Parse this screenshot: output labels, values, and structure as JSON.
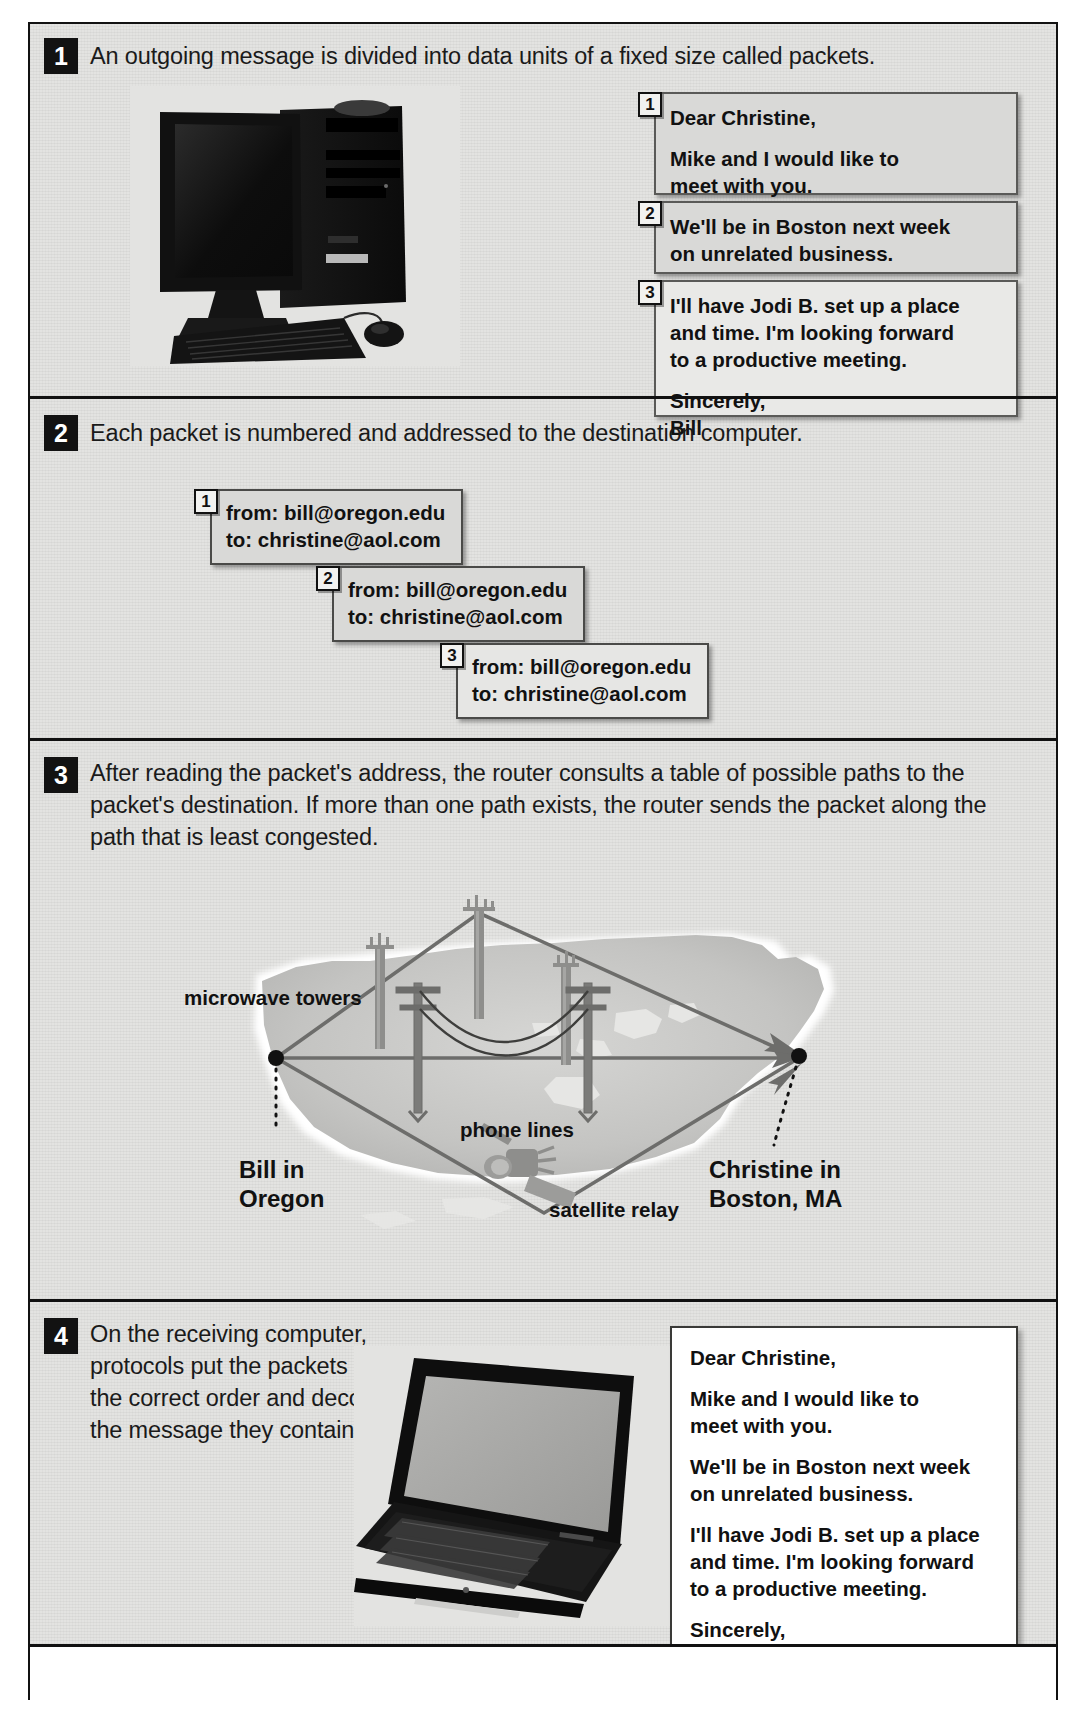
{
  "figure": {
    "steps": [
      {
        "number": "1",
        "text": "An outgoing message is divided into data units of a fixed size called packets.",
        "image": "desktop-computer-photo"
      },
      {
        "number": "2",
        "text": "Each packet is numbered and addressed to the destination computer."
      },
      {
        "number": "3",
        "text": "After reading the packet's address, the router consults a table of possible paths to the packet's destination. If more than one path exists, the router sends the packet along the path that is least congested."
      },
      {
        "number": "4",
        "text": "On the receiving computer, protocols put the packets in the correct order and decode the message they contain.",
        "image": "laptop-computer-photo"
      }
    ]
  },
  "message_packets": [
    {
      "number": "1",
      "lines": [
        "Dear Christine,",
        "Mike and I would like to",
        "meet with you."
      ]
    },
    {
      "number": "2",
      "lines": [
        "We'll be in Boston next week",
        "on unrelated business."
      ]
    },
    {
      "number": "3",
      "lines": [
        "I'll have Jodi B. set up a place",
        "and time. I'm looking forward",
        "to a productive meeting.",
        "Sincerely,",
        "Bill"
      ]
    }
  ],
  "addressed_packets": [
    {
      "number": "1",
      "from": "from: bill@oregon.edu",
      "to": "to: christine@aol.com"
    },
    {
      "number": "2",
      "from": "from: bill@oregon.edu",
      "to": "to: christine@aol.com"
    },
    {
      "number": "3",
      "from": "from: bill@oregon.edu",
      "to": "to: christine@aol.com"
    }
  ],
  "map": {
    "labels": {
      "microwave_towers": "microwave towers",
      "phone_lines": "phone lines",
      "satellite_relay": "satellite relay",
      "origin_line1": "Bill in",
      "origin_line2": "Oregon",
      "destination_line1": "Christine in",
      "destination_line2": "Boston, MA"
    }
  },
  "received_letter": {
    "greeting": "Dear Christine,",
    "para1_line1": "Mike and I would like to",
    "para1_line2": "meet with you.",
    "para2_line1": "We'll be in Boston next week",
    "para2_line2": "on unrelated business.",
    "para3_line1": "I'll have Jodi B. set up a place",
    "para3_line2": "and time. I'm looking forward",
    "para3_line3": "to a productive meeting.",
    "closing": "Sincerely,",
    "signature": "Bill"
  },
  "colors": {
    "panel_bg": "#e3e3e1",
    "packet_bg": "#d9d9d7",
    "letter_bg": "#ffffff",
    "border": "#111111",
    "map_land": "#c8c8c6",
    "map_line": "#6d6d6b"
  }
}
